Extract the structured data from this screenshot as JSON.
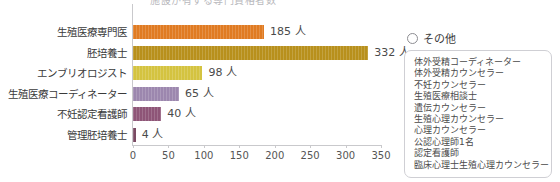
{
  "title_fragment": {
    "text": "施設が有する専門資格者数"
  },
  "chart_data": {
    "type": "bar",
    "orientation": "horizontal",
    "title": "",
    "xlabel": "",
    "ylabel": "",
    "xlim": [
      0,
      350
    ],
    "grid": false,
    "unit_suffix": "人",
    "categories": [
      "生殖医療専門医",
      "胚培養士",
      "エンブリオロジスト",
      "生殖医療コーディネーター",
      "不妊認定看護師",
      "管理胚培養士"
    ],
    "values": [
      185,
      332,
      98,
      65,
      40,
      4
    ],
    "value_labels": [
      "185 人",
      "332 人",
      "98 人",
      "65 人",
      "40 人",
      "4 人"
    ],
    "colors": [
      "#E07B22",
      "#B8901C",
      "#D4C340",
      "#9C87AE",
      "#8E5577",
      "#7A4A63"
    ],
    "tick_labels": [
      "0",
      "50",
      "100",
      "150",
      "200",
      "250",
      "300",
      "350"
    ],
    "tick_values": [
      0,
      50,
      100,
      150,
      200,
      250,
      300,
      350
    ]
  },
  "legend": {
    "radio_icon": "radio-circle-icon",
    "title": "その他",
    "items": [
      "体外受精コーディネーター",
      "体外受精カウンセラー",
      "不妊カウンセラー",
      "生殖医療相談士",
      "遺伝カウンセラー",
      "生殖心理カウンセラー",
      "心理カウンセラー",
      "公認心理師1名",
      "認定看護師",
      "臨床心理士生殖心理カウンセラー"
    ]
  }
}
